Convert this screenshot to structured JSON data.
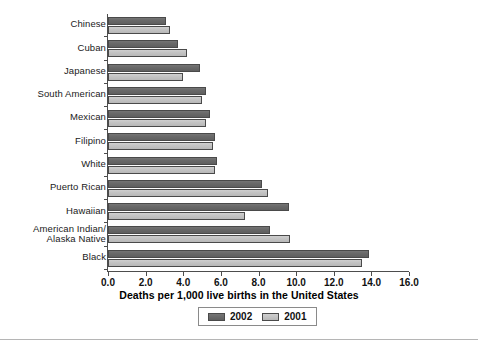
{
  "chart_data": {
    "type": "bar",
    "orientation": "horizontal",
    "title": "",
    "xlabel": "Deaths per 1,000 live births in the United States",
    "ylabel": "",
    "xlim": [
      0.0,
      16.0
    ],
    "xticks": [
      "0.0",
      "2.0",
      "4.0",
      "6.0",
      "8.0",
      "10.0",
      "12.0",
      "14.0",
      "16.0"
    ],
    "grid": false,
    "legend_position": "bottom-center",
    "categories": [
      "Chinese",
      "Cuban",
      "Japanese",
      "South American",
      "Mexican",
      "Filipino",
      "White",
      "Puerto Rican",
      "Hawaiian",
      "American Indian/|Alaska Native",
      "Black"
    ],
    "series": [
      {
        "name": "2002",
        "color": "#6a6a6a",
        "values": [
          3.1,
          3.7,
          4.9,
          5.2,
          5.4,
          5.7,
          5.8,
          8.2,
          9.6,
          8.6,
          13.9
        ]
      },
      {
        "name": "2001",
        "color": "#c4c4c4",
        "values": [
          3.3,
          4.2,
          4.0,
          5.0,
          5.2,
          5.6,
          5.7,
          8.5,
          7.3,
          9.7,
          13.5
        ]
      }
    ]
  },
  "axis": {
    "title": "Deaths per 1,000 live births in the United States"
  },
  "legend": {
    "items": [
      {
        "label": "2002"
      },
      {
        "label": "2001"
      }
    ]
  }
}
